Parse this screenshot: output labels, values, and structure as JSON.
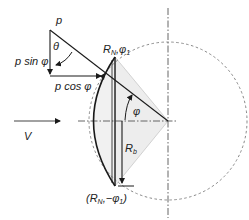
{
  "diagram": {
    "type": "geometry-sketch",
    "labels": {
      "p": "p",
      "theta": "θ",
      "p_sin_phi": "p sin φ",
      "p_cos_phi": "p cos φ",
      "V": "V",
      "phi": "φ",
      "R_b": "R",
      "R_b_sub": "b",
      "top_point_R": "R",
      "top_point_R_sub": "N",
      "top_point_phi": ",φ",
      "top_point_phi_sub": "1",
      "bottom_point_open": "(R",
      "bottom_point_R_sub": "N",
      "bottom_point_phi": ",−φ",
      "bottom_point_phi_sub": "1",
      "bottom_point_close": ")"
    },
    "colors": {
      "line": "#1a1a1a",
      "dashed": "#888888",
      "shade": "#ececec",
      "axis": "#555555"
    }
  }
}
